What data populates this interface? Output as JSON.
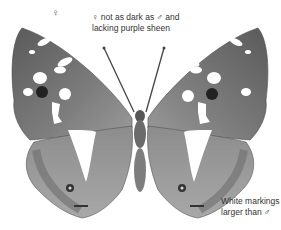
{
  "figure": {
    "sex_symbol": "♀",
    "annotations": [
      {
        "id": "top",
        "lines": [
          "♀ not as dark as ♂ and",
          "lacking purple sheen"
        ]
      },
      {
        "id": "bottom-right",
        "lines": [
          "White markings",
          "larger than ♂"
        ]
      }
    ],
    "colors": {
      "wing_dark": "#5e5e5e",
      "wing_mid": "#8a8a8a",
      "wing_light": "#b5b5b5",
      "markings": "#ffffff",
      "eyespot": "#222222",
      "body": "#6b6b6b"
    }
  }
}
